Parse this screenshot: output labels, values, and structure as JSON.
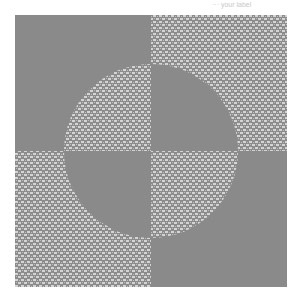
{
  "figure": {
    "caption": "··· your label",
    "quadrants": [
      {
        "name": "top-left",
        "outside": "solid",
        "circle": "texture"
      },
      {
        "name": "top-right",
        "outside": "texture",
        "circle": "solid"
      },
      {
        "name": "bottom-left",
        "outside": "texture",
        "circle": "solid"
      },
      {
        "name": "bottom-right",
        "outside": "solid",
        "circle": "texture"
      }
    ],
    "colors": {
      "solid": "#8a8a8a",
      "texture_dark": "#8c8c8c",
      "texture_light": "#d4d4d4",
      "background": "#ffffff"
    }
  }
}
